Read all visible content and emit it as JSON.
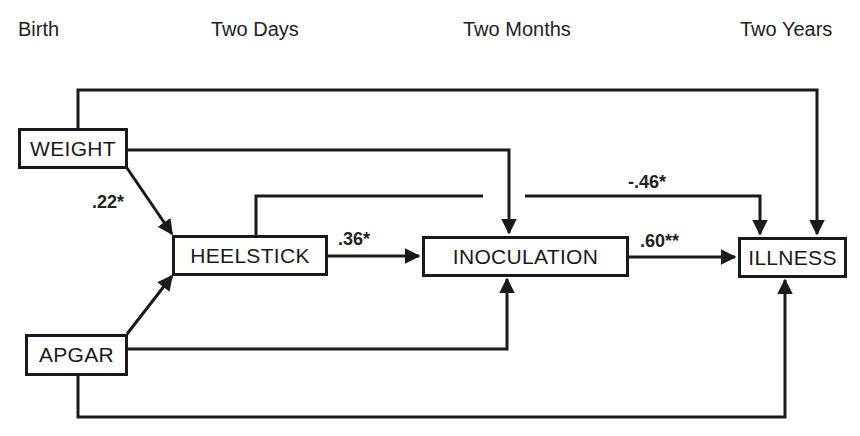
{
  "time_points": [
    {
      "label": "Birth"
    },
    {
      "label": "Two Days"
    },
    {
      "label": "Two Months"
    },
    {
      "label": "Two Years"
    }
  ],
  "nodes": {
    "weight": {
      "label": "WEIGHT"
    },
    "apgar": {
      "label": "APGAR"
    },
    "heelstick": {
      "label": "HEELSTICK"
    },
    "inoculation": {
      "label": "INOCULATION"
    },
    "illness": {
      "label": "ILLNESS"
    }
  },
  "paths": [
    {
      "from": "WEIGHT",
      "to": "HEELSTICK",
      "coefficient": ".22*"
    },
    {
      "from": "APGAR",
      "to": "HEELSTICK",
      "coefficient": ""
    },
    {
      "from": "HEELSTICK",
      "to": "INOCULATION",
      "coefficient": ".36*"
    },
    {
      "from": "INOCULATION",
      "to": "ILLNESS",
      "coefficient": ".60**"
    },
    {
      "from": "HEELSTICK",
      "to": "ILLNESS",
      "coefficient": "-.46*"
    },
    {
      "from": "WEIGHT",
      "to": "INOCULATION",
      "coefficient": ""
    },
    {
      "from": "WEIGHT",
      "to": "ILLNESS",
      "coefficient": ""
    },
    {
      "from": "APGAR",
      "to": "INOCULATION",
      "coefficient": ""
    },
    {
      "from": "APGAR",
      "to": "ILLNESS",
      "coefficient": ""
    }
  ],
  "colors": {
    "line": "#1a1a1a",
    "background": "#ffffff"
  }
}
